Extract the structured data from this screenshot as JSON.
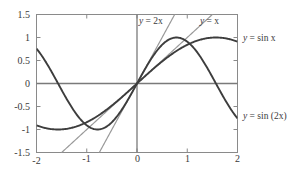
{
  "chart_data": {
    "type": "line",
    "title": "",
    "xlabel": "",
    "ylabel": "",
    "xlim": [
      -2,
      2
    ],
    "ylim": [
      -1.5,
      1.5
    ],
    "grid": false,
    "legend_position": "inline-annotations",
    "x_ticks": [
      -2,
      -1,
      0,
      1,
      2
    ],
    "x_tick_labels": [
      "-2",
      "-1",
      "0",
      "1",
      "2"
    ],
    "y_ticks": [
      -1.5,
      -1,
      -0.5,
      0,
      0.5,
      1,
      1.5
    ],
    "y_tick_labels": [
      "-1.5",
      "-1",
      "-0.5",
      "0",
      "0.5",
      "1",
      "1.5"
    ],
    "series": [
      {
        "name": "y = sin x",
        "kind": "curve",
        "color": "#3d3d3d",
        "width": 1.9,
        "expression": "sin(x)",
        "x": [
          -2,
          -1.8,
          -1.6,
          -1.4,
          -1.2,
          -1,
          -0.8,
          -0.6,
          -0.4,
          -0.2,
          0,
          0.2,
          0.4,
          0.6,
          0.8,
          1,
          1.2,
          1.4,
          1.6,
          1.8,
          2
        ],
        "values": [
          -0.909,
          -0.974,
          -1.0,
          -0.985,
          -0.932,
          -0.841,
          -0.717,
          -0.565,
          -0.389,
          -0.199,
          0,
          0.199,
          0.389,
          0.565,
          0.717,
          0.841,
          0.932,
          0.985,
          1.0,
          0.974,
          0.909
        ]
      },
      {
        "name": "y = sin (2x)",
        "kind": "curve",
        "color": "#3d3d3d",
        "width": 1.9,
        "expression": "sin(2x)",
        "x": [
          -2,
          -1.8,
          -1.6,
          -1.4,
          -1.2,
          -1,
          -0.8,
          -0.6,
          -0.4,
          -0.2,
          0,
          0.2,
          0.4,
          0.6,
          0.8,
          1,
          1.2,
          1.4,
          1.6,
          1.8,
          2
        ],
        "values": [
          0.757,
          0.443,
          0.058,
          -0.335,
          -0.675,
          -0.909,
          -0.9996,
          -0.932,
          -0.717,
          -0.389,
          0,
          0.389,
          0.717,
          0.932,
          0.9996,
          0.909,
          0.675,
          0.335,
          -0.058,
          -0.443,
          -0.757
        ]
      },
      {
        "name": "y = x",
        "kind": "line",
        "color": "#9a9a9a",
        "width": 1.2,
        "expression": "x",
        "slope": 1,
        "x": [
          -1.5,
          1.5
        ],
        "values": [
          -1.5,
          1.5
        ]
      },
      {
        "name": "y = 2x",
        "kind": "line",
        "color": "#9a9a9a",
        "width": 1.2,
        "expression": "2x",
        "slope": 2,
        "x": [
          -0.75,
          0.75
        ],
        "values": [
          -1.5,
          1.5
        ]
      }
    ],
    "annotations": [
      {
        "id": "label-y-2x",
        "text_italic": "y",
        "text_rest": " = 2x",
        "x": 0.05,
        "y": 1.34
      },
      {
        "id": "label-y-x",
        "text_italic": "y",
        "text_rest": " = x",
        "x": 1.06,
        "y": 1.34
      },
      {
        "id": "label-y-sin-x",
        "text_italic": "y",
        "text_rest": " = sin x",
        "x": 2.12,
        "y": 0.93
      },
      {
        "id": "label-y-sin-2x",
        "text_italic": "y",
        "text_rest": " = sin (2x)",
        "x": 2.12,
        "y": -0.56
      }
    ],
    "axis_lines": {
      "x_axis_at_y": 0,
      "y_axis_at_x": 0,
      "color": "#7a7a7a"
    },
    "frame": {
      "color": "#8a8a8a",
      "tick_direction": "in"
    }
  },
  "labels": {
    "y_1_5": "1.5",
    "y_1": "1",
    "y_0_5": "0.5",
    "y_0": "0",
    "y_m0_5": "-0.5",
    "y_m1": "-1",
    "y_m1_5": "-1.5",
    "x_m2": "-2",
    "x_m1": "-1",
    "x_0": "0",
    "x_1": "1",
    "x_2": "2"
  },
  "annotation_text": {
    "y_2x_var": "y",
    "y_2x_rest": " = 2x",
    "y_x_var": "y",
    "y_x_rest": " = x",
    "y_sin_x_var": "y",
    "y_sin_x_rest": " = sin x",
    "y_sin_2x_var": "y",
    "y_sin_2x_rest": " = sin (2x)"
  }
}
